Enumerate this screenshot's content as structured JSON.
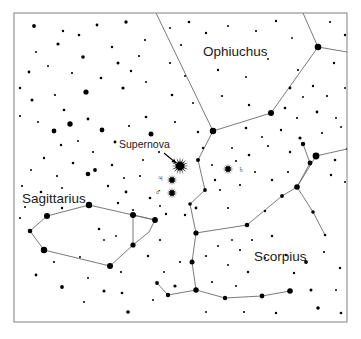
{
  "chart_data": {
    "type": "scatter",
    "xlabel": "",
    "ylabel": "",
    "xlim": [
      0,
      361
    ],
    "ylim": [
      0,
      339
    ],
    "grid": false,
    "legend": null,
    "background_color": "#ffffff",
    "ink_color": "#000000",
    "line_color": "#6b6b6b",
    "frame": {
      "x": 14,
      "y": 13,
      "width": 333,
      "height": 309,
      "stroke": "#8a8a8a"
    },
    "annotations": [
      {
        "name": "supernova-label",
        "text": "Supernova",
        "x": 119,
        "y": 148,
        "type": "callout"
      },
      {
        "name": "ophiuchus-label",
        "text": "Ophiuchus",
        "x": 203,
        "y": 56,
        "type": "constellation"
      },
      {
        "name": "sagittarius-label",
        "text": "Sagittarius",
        "x": 22,
        "y": 203,
        "type": "constellation"
      },
      {
        "name": "scorpius-label",
        "text": "Scorpius",
        "x": 254,
        "y": 261,
        "type": "constellation"
      }
    ],
    "arrow": {
      "name": "supernova-arrow",
      "x1": 164,
      "y1": 153,
      "x2": 176,
      "y2": 163
    },
    "markers": [
      {
        "name": "supernova-marker",
        "symbol": "starburst",
        "x": 180,
        "y": 166,
        "radius": 9,
        "rays": 16,
        "label": "Supernova"
      },
      {
        "name": "jupiter-marker",
        "symbol": "starburst",
        "x": 172,
        "y": 180,
        "radius": 5.5,
        "rays": 12,
        "glyph": "♃",
        "glyph_x": 160,
        "glyph_y": 181,
        "label": "Jupiter"
      },
      {
        "name": "mars-marker",
        "symbol": "starburst",
        "x": 172,
        "y": 193,
        "radius": 5.5,
        "rays": 12,
        "glyph": "♂",
        "glyph_x": 158,
        "glyph_y": 195,
        "label": "Mars"
      },
      {
        "name": "saturn-marker",
        "symbol": "starburst",
        "x": 228,
        "y": 169,
        "radius": 5.5,
        "rays": 12,
        "glyph": "♄",
        "glyph_x": 241,
        "glyph_y": 172,
        "label": "Saturn"
      }
    ],
    "constellation_lines": [
      {
        "name": "ophiuchus-lines",
        "points": [
          [
            156,
            13
          ],
          [
            213,
            131
          ],
          [
            271,
            113
          ],
          [
            318,
            47
          ],
          [
            347,
            52
          ]
        ]
      },
      {
        "name": "ophiuchus-branch-top",
        "points": [
          [
            318,
            47
          ],
          [
            303,
            13
          ]
        ]
      },
      {
        "name": "ophiuchus-branch-down",
        "points": [
          [
            213,
            131
          ],
          [
            198,
            160
          ],
          [
            205,
            190
          ],
          [
            190,
            204
          ],
          [
            196,
            233
          ]
        ]
      },
      {
        "name": "scorpius-head",
        "points": [
          [
            196,
            233
          ],
          [
            247,
            225
          ],
          [
            282,
            196
          ],
          [
            297,
            187
          ],
          [
            316,
            156
          ]
        ]
      },
      {
        "name": "scorpius-upper-right",
        "points": [
          [
            316,
            156
          ],
          [
            347,
            149
          ]
        ]
      },
      {
        "name": "scorpius-right-branch",
        "points": [
          [
            297,
            187
          ],
          [
            310,
            163
          ],
          [
            303,
            144
          ]
        ]
      },
      {
        "name": "scorpius-right-down",
        "points": [
          [
            297,
            187
          ],
          [
            313,
            212
          ],
          [
            325,
            235
          ]
        ]
      },
      {
        "name": "scorpius-tail",
        "points": [
          [
            196,
            233
          ],
          [
            192,
            262
          ],
          [
            196,
            290
          ],
          [
            225,
            298
          ],
          [
            262,
            296
          ],
          [
            290,
            291
          ]
        ]
      },
      {
        "name": "scorpius-tail-left",
        "points": [
          [
            196,
            290
          ],
          [
            168,
            295
          ],
          [
            157,
            283
          ]
        ]
      },
      {
        "name": "sagittarius-teapot",
        "points": [
          [
            47,
            216
          ],
          [
            30,
            231
          ],
          [
            44,
            250
          ],
          [
            110,
            266
          ],
          [
            133,
            245
          ],
          [
            133,
            215
          ],
          [
            89,
            205
          ],
          [
            47,
            216
          ]
        ]
      },
      {
        "name": "sagittarius-handle",
        "points": [
          [
            133,
            215
          ],
          [
            155,
            220
          ],
          [
            149,
            232
          ],
          [
            133,
            245
          ]
        ]
      },
      {
        "name": "sagittarius-cross",
        "points": [
          [
            133,
            215
          ],
          [
            155,
            220
          ]
        ]
      }
    ],
    "stars": [
      {
        "x": 34,
        "y": 26,
        "r": 1.9
      },
      {
        "x": 63,
        "y": 31,
        "r": 1.2
      },
      {
        "x": 97,
        "y": 25,
        "r": 1.4
      },
      {
        "x": 126,
        "y": 22,
        "r": 1.7
      },
      {
        "x": 145,
        "y": 40,
        "r": 1.1
      },
      {
        "x": 36,
        "y": 52,
        "r": 1.0
      },
      {
        "x": 58,
        "y": 44,
        "r": 1.6
      },
      {
        "x": 79,
        "y": 35,
        "r": 1.3
      },
      {
        "x": 83,
        "y": 57,
        "r": 1.8
      },
      {
        "x": 112,
        "y": 47,
        "r": 1.2
      },
      {
        "x": 118,
        "y": 63,
        "r": 1.5
      },
      {
        "x": 139,
        "y": 56,
        "r": 1.1
      },
      {
        "x": 29,
        "y": 72,
        "r": 1.4
      },
      {
        "x": 48,
        "y": 66,
        "r": 1.0
      },
      {
        "x": 72,
        "y": 73,
        "r": 1.1
      },
      {
        "x": 101,
        "y": 78,
        "r": 1.3
      },
      {
        "x": 86,
        "y": 92,
        "r": 2.6
      },
      {
        "x": 123,
        "y": 88,
        "r": 1.6
      },
      {
        "x": 131,
        "y": 71,
        "r": 1.2
      },
      {
        "x": 146,
        "y": 82,
        "r": 1.0
      },
      {
        "x": 20,
        "y": 88,
        "r": 1.2
      },
      {
        "x": 32,
        "y": 100,
        "r": 1.5
      },
      {
        "x": 55,
        "y": 95,
        "r": 1.1
      },
      {
        "x": 64,
        "y": 110,
        "r": 1.3
      },
      {
        "x": 20,
        "y": 116,
        "r": 1.1
      },
      {
        "x": 38,
        "y": 122,
        "r": 1.0
      },
      {
        "x": 54,
        "y": 131,
        "r": 2.4
      },
      {
        "x": 70,
        "y": 124,
        "r": 2.7
      },
      {
        "x": 88,
        "y": 119,
        "r": 1.4
      },
      {
        "x": 102,
        "y": 130,
        "r": 2.4
      },
      {
        "x": 61,
        "y": 145,
        "r": 1.2
      },
      {
        "x": 78,
        "y": 141,
        "r": 1.0
      },
      {
        "x": 93,
        "y": 152,
        "r": 1.1
      },
      {
        "x": 115,
        "y": 142,
        "r": 1.4
      },
      {
        "x": 129,
        "y": 126,
        "r": 1.1
      },
      {
        "x": 146,
        "y": 117,
        "r": 1.3
      },
      {
        "x": 151,
        "y": 134,
        "r": 2.5
      },
      {
        "x": 44,
        "y": 158,
        "r": 1.2
      },
      {
        "x": 31,
        "y": 170,
        "r": 1.0
      },
      {
        "x": 57,
        "y": 176,
        "r": 1.1
      },
      {
        "x": 73,
        "y": 163,
        "r": 1.3
      },
      {
        "x": 88,
        "y": 174,
        "r": 2.3
      },
      {
        "x": 95,
        "y": 170,
        "r": 1.9
      },
      {
        "x": 112,
        "y": 165,
        "r": 1.2
      },
      {
        "x": 124,
        "y": 178,
        "r": 1.0
      },
      {
        "x": 22,
        "y": 186,
        "r": 1.1
      },
      {
        "x": 41,
        "y": 192,
        "r": 1.3
      },
      {
        "x": 62,
        "y": 188,
        "r": 1.0
      },
      {
        "x": 108,
        "y": 186,
        "r": 1.2
      },
      {
        "x": 126,
        "y": 192,
        "r": 1.4
      },
      {
        "x": 140,
        "y": 176,
        "r": 1.1
      },
      {
        "x": 25,
        "y": 207,
        "r": 1.0
      },
      {
        "x": 118,
        "y": 203,
        "r": 1.2
      },
      {
        "x": 133,
        "y": 210,
        "r": 1.0
      },
      {
        "x": 150,
        "y": 198,
        "r": 1.3
      },
      {
        "x": 20,
        "y": 218,
        "r": 1.1
      },
      {
        "x": 62,
        "y": 208,
        "r": 1.2
      },
      {
        "x": 47,
        "y": 216,
        "r": 3.0
      },
      {
        "x": 30,
        "y": 231,
        "r": 2.3
      },
      {
        "x": 44,
        "y": 250,
        "r": 3.2
      },
      {
        "x": 89,
        "y": 205,
        "r": 3.2
      },
      {
        "x": 133,
        "y": 215,
        "r": 3.0
      },
      {
        "x": 155,
        "y": 220,
        "r": 2.9
      },
      {
        "x": 133,
        "y": 245,
        "r": 2.6
      },
      {
        "x": 110,
        "y": 266,
        "r": 3.0
      },
      {
        "x": 99,
        "y": 229,
        "r": 1.3
      },
      {
        "x": 104,
        "y": 240,
        "r": 0.9
      },
      {
        "x": 116,
        "y": 236,
        "r": 0.9
      },
      {
        "x": 80,
        "y": 257,
        "r": 1.0
      },
      {
        "x": 54,
        "y": 262,
        "r": 1.1
      },
      {
        "x": 166,
        "y": 214,
        "r": 1.2
      },
      {
        "x": 160,
        "y": 240,
        "r": 1.1
      },
      {
        "x": 148,
        "y": 256,
        "r": 1.2
      },
      {
        "x": 36,
        "y": 275,
        "r": 1.4
      },
      {
        "x": 62,
        "y": 287,
        "r": 1.9
      },
      {
        "x": 88,
        "y": 278,
        "r": 1.0
      },
      {
        "x": 104,
        "y": 291,
        "r": 1.5
      },
      {
        "x": 122,
        "y": 293,
        "r": 1.3
      },
      {
        "x": 121,
        "y": 272,
        "r": 1.1
      },
      {
        "x": 84,
        "y": 302,
        "r": 1.0
      },
      {
        "x": 128,
        "y": 312,
        "r": 1.8
      },
      {
        "x": 153,
        "y": 300,
        "r": 1.0
      },
      {
        "x": 170,
        "y": 28,
        "r": 1.0
      },
      {
        "x": 189,
        "y": 22,
        "r": 1.3
      },
      {
        "x": 181,
        "y": 45,
        "r": 1.1
      },
      {
        "x": 206,
        "y": 33,
        "r": 1.2
      },
      {
        "x": 228,
        "y": 26,
        "r": 1.0
      },
      {
        "x": 256,
        "y": 31,
        "r": 1.1
      },
      {
        "x": 276,
        "y": 21,
        "r": 1.2
      },
      {
        "x": 292,
        "y": 38,
        "r": 0.9
      },
      {
        "x": 330,
        "y": 22,
        "r": 1.1
      },
      {
        "x": 345,
        "y": 35,
        "r": 1.2
      },
      {
        "x": 170,
        "y": 63,
        "r": 1.1
      },
      {
        "x": 185,
        "y": 76,
        "r": 1.0
      },
      {
        "x": 218,
        "y": 70,
        "r": 1.2
      },
      {
        "x": 246,
        "y": 77,
        "r": 1.0
      },
      {
        "x": 268,
        "y": 59,
        "r": 0.9
      },
      {
        "x": 298,
        "y": 70,
        "r": 1.1
      },
      {
        "x": 334,
        "y": 63,
        "r": 1.2
      },
      {
        "x": 172,
        "y": 95,
        "r": 1.3
      },
      {
        "x": 193,
        "y": 103,
        "r": 1.0
      },
      {
        "x": 222,
        "y": 96,
        "r": 1.1
      },
      {
        "x": 249,
        "y": 105,
        "r": 1.2
      },
      {
        "x": 290,
        "y": 88,
        "r": 1.4
      },
      {
        "x": 303,
        "y": 97,
        "r": 1.0
      },
      {
        "x": 313,
        "y": 86,
        "r": 1.2
      },
      {
        "x": 327,
        "y": 96,
        "r": 1.1
      },
      {
        "x": 345,
        "y": 88,
        "r": 1.0
      },
      {
        "x": 285,
        "y": 108,
        "r": 1.3
      },
      {
        "x": 297,
        "y": 118,
        "r": 1.1
      },
      {
        "x": 317,
        "y": 112,
        "r": 1.4
      },
      {
        "x": 336,
        "y": 118,
        "r": 1.0
      },
      {
        "x": 175,
        "y": 122,
        "r": 1.1
      },
      {
        "x": 198,
        "y": 132,
        "r": 1.2
      },
      {
        "x": 246,
        "y": 128,
        "r": 1.3
      },
      {
        "x": 262,
        "y": 137,
        "r": 1.0
      },
      {
        "x": 281,
        "y": 130,
        "r": 1.2
      },
      {
        "x": 300,
        "y": 138,
        "r": 1.6
      },
      {
        "x": 322,
        "y": 133,
        "r": 1.1
      },
      {
        "x": 341,
        "y": 127,
        "r": 1.0
      },
      {
        "x": 203,
        "y": 148,
        "r": 1.2
      },
      {
        "x": 232,
        "y": 148,
        "r": 1.0
      },
      {
        "x": 249,
        "y": 155,
        "r": 1.3
      },
      {
        "x": 268,
        "y": 146,
        "r": 1.1
      },
      {
        "x": 290,
        "y": 152,
        "r": 1.2
      },
      {
        "x": 303,
        "y": 144,
        "r": 2.2
      },
      {
        "x": 316,
        "y": 156,
        "r": 3.4
      },
      {
        "x": 335,
        "y": 160,
        "r": 1.3
      },
      {
        "x": 347,
        "y": 149,
        "r": 1.2
      },
      {
        "x": 215,
        "y": 180,
        "r": 1.2
      },
      {
        "x": 240,
        "y": 185,
        "r": 1.1
      },
      {
        "x": 212,
        "y": 165,
        "r": 1.0
      },
      {
        "x": 255,
        "y": 172,
        "r": 1.0
      },
      {
        "x": 272,
        "y": 180,
        "r": 1.2
      },
      {
        "x": 288,
        "y": 172,
        "r": 1.1
      },
      {
        "x": 310,
        "y": 163,
        "r": 2.4
      },
      {
        "x": 331,
        "y": 175,
        "r": 1.2
      },
      {
        "x": 345,
        "y": 182,
        "r": 1.0
      },
      {
        "x": 297,
        "y": 187,
        "r": 2.8
      },
      {
        "x": 282,
        "y": 196,
        "r": 1.9
      },
      {
        "x": 247,
        "y": 225,
        "r": 2.3
      },
      {
        "x": 196,
        "y": 233,
        "r": 2.6
      },
      {
        "x": 192,
        "y": 262,
        "r": 2.5
      },
      {
        "x": 196,
        "y": 290,
        "r": 2.7
      },
      {
        "x": 225,
        "y": 298,
        "r": 2.2
      },
      {
        "x": 262,
        "y": 296,
        "r": 2.4
      },
      {
        "x": 290,
        "y": 291,
        "r": 2.8
      },
      {
        "x": 313,
        "y": 212,
        "r": 1.8
      },
      {
        "x": 325,
        "y": 235,
        "r": 1.3
      },
      {
        "x": 168,
        "y": 295,
        "r": 2.2
      },
      {
        "x": 157,
        "y": 283,
        "r": 1.9
      },
      {
        "x": 175,
        "y": 286,
        "r": 1.6
      },
      {
        "x": 228,
        "y": 208,
        "r": 1.1
      },
      {
        "x": 265,
        "y": 211,
        "r": 1.2
      },
      {
        "x": 240,
        "y": 250,
        "r": 1.1
      },
      {
        "x": 228,
        "y": 265,
        "r": 1.0
      },
      {
        "x": 248,
        "y": 272,
        "r": 1.2
      },
      {
        "x": 265,
        "y": 258,
        "r": 1.0
      },
      {
        "x": 286,
        "y": 255,
        "r": 1.2
      },
      {
        "x": 306,
        "y": 262,
        "r": 1.9
      },
      {
        "x": 324,
        "y": 252,
        "r": 1.1
      },
      {
        "x": 340,
        "y": 268,
        "r": 1.2
      },
      {
        "x": 218,
        "y": 246,
        "r": 1.0
      },
      {
        "x": 206,
        "y": 256,
        "r": 1.1
      },
      {
        "x": 232,
        "y": 240,
        "r": 0.9
      },
      {
        "x": 294,
        "y": 273,
        "r": 1.2
      },
      {
        "x": 311,
        "y": 290,
        "r": 1.5
      },
      {
        "x": 336,
        "y": 290,
        "r": 1.0
      },
      {
        "x": 318,
        "y": 308,
        "r": 1.8
      },
      {
        "x": 341,
        "y": 313,
        "r": 1.3
      },
      {
        "x": 276,
        "y": 313,
        "r": 1.2
      },
      {
        "x": 244,
        "y": 312,
        "r": 1.1
      },
      {
        "x": 206,
        "y": 312,
        "r": 1.0
      },
      {
        "x": 180,
        "y": 262,
        "r": 1.1
      },
      {
        "x": 164,
        "y": 272,
        "r": 1.0
      },
      {
        "x": 212,
        "y": 282,
        "r": 1.1
      },
      {
        "x": 236,
        "y": 286,
        "r": 1.0
      },
      {
        "x": 252,
        "y": 240,
        "r": 1.1
      },
      {
        "x": 272,
        "y": 236,
        "r": 1.2
      },
      {
        "x": 159,
        "y": 152,
        "r": 1.1
      },
      {
        "x": 143,
        "y": 160,
        "r": 1.0
      },
      {
        "x": 196,
        "y": 208,
        "r": 1.4
      },
      {
        "x": 185,
        "y": 215,
        "r": 1.2
      },
      {
        "x": 160,
        "y": 206,
        "r": 1.0
      },
      {
        "x": 236,
        "y": 161,
        "r": 1.0
      },
      {
        "x": 220,
        "y": 190,
        "r": 1.0
      },
      {
        "x": 205,
        "y": 190,
        "r": 1.9
      },
      {
        "x": 190,
        "y": 204,
        "r": 1.8
      },
      {
        "x": 198,
        "y": 160,
        "r": 2.0
      },
      {
        "x": 213,
        "y": 131,
        "r": 3.2
      },
      {
        "x": 271,
        "y": 113,
        "r": 3.0
      },
      {
        "x": 318,
        "y": 47,
        "r": 3.3
      }
    ]
  }
}
